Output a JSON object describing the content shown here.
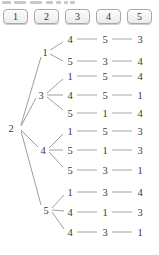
{
  "palette": {
    "background": "#ffffff",
    "key_background": "#f3f3f3",
    "key_border": "#a8a8a8",
    "digit_color": "#3a3a3a",
    "edge_color": "#949494",
    "row_connector_color": "#adadad"
  },
  "keys": {
    "items": [
      {
        "label": "1"
      },
      {
        "label": "2"
      },
      {
        "label": "3"
      },
      {
        "label": "4"
      },
      {
        "label": "5"
      }
    ]
  },
  "tree": {
    "root_label": "2",
    "children": [
      {
        "label": "1",
        "rows": [
          {
            "digits": [
              "4",
              "5",
              "3"
            ]
          },
          {
            "digits": [
              "5",
              "3",
              "4"
            ]
          }
        ]
      },
      {
        "label": "3",
        "rows": [
          {
            "digits": [
              "1",
              "5",
              "4"
            ]
          },
          {
            "digits": [
              "4",
              "5",
              "1"
            ]
          },
          {
            "digits": [
              "5",
              "1",
              "4"
            ]
          }
        ]
      },
      {
        "label": "4",
        "rows": [
          {
            "digits": [
              "1",
              "5",
              "3"
            ]
          },
          {
            "digits": [
              "5",
              "1",
              "3"
            ]
          },
          {
            "digits": [
              "5",
              "3",
              "1"
            ]
          }
        ]
      },
      {
        "label": "5",
        "rows": [
          {
            "digits": [
              "1",
              "3",
              "4"
            ]
          },
          {
            "digits": [
              "4",
              "1",
              "3"
            ]
          },
          {
            "digits": [
              "4",
              "3",
              "1"
            ]
          }
        ]
      }
    ]
  }
}
